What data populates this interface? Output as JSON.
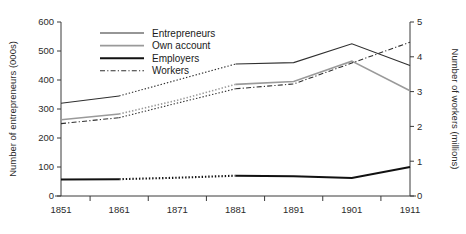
{
  "chart_data": {
    "type": "line",
    "title": "",
    "xlabel": "",
    "ylabel": "Number of entrepreneurs (000s)",
    "y2label": "Number of workers (millions)",
    "categories": [
      "1851",
      "1861",
      "1871",
      "1881",
      "1891",
      "1901",
      "1911"
    ],
    "x": [
      1851,
      1861,
      1871,
      1881,
      1891,
      1901,
      1911
    ],
    "ylim": [
      0,
      600
    ],
    "yticks": [
      0,
      100,
      200,
      300,
      400,
      500,
      600
    ],
    "y2lim": [
      0,
      5
    ],
    "y2ticks": [
      0,
      1,
      2,
      3,
      4,
      5
    ],
    "grid": false,
    "legend_position": "top-left-inside",
    "series": [
      {
        "name": "Entrepreneurs",
        "axis": "left",
        "color": "#2f2f2f",
        "width": 1.1,
        "style": "solid-dotted-solid",
        "values": [
          320,
          345,
          400,
          455,
          460,
          525,
          450
        ],
        "dotted_segment": [
          "1861",
          "1881"
        ]
      },
      {
        "name": "Own account",
        "axis": "left",
        "color": "#9a9a9a",
        "width": 1.6,
        "style": "solid-dotted-solid",
        "values": [
          263,
          283,
          330,
          385,
          395,
          465,
          363
        ],
        "dotted_segment": [
          "1861",
          "1881"
        ]
      },
      {
        "name": "Employers",
        "axis": "left",
        "color": "#111111",
        "width": 2.1,
        "style": "solid-dotted-solid",
        "values": [
          57,
          58,
          63,
          70,
          68,
          62,
          100
        ],
        "dotted_segment": [
          "1861",
          "1881"
        ]
      },
      {
        "name": "Workers",
        "axis": "right",
        "color": "#2f2f2f",
        "width": 1.1,
        "style": "dashdot-dotted-dashdot",
        "values": [
          2.08,
          2.25,
          2.67,
          3.08,
          3.22,
          3.82,
          4.42
        ],
        "dotted_segment": [
          "1861",
          "1881"
        ]
      }
    ]
  },
  "legend": {
    "items": [
      {
        "label": "Entrepreneurs",
        "swatch": "thin-solid-line"
      },
      {
        "label": "Own account",
        "swatch": "grey-solid-line"
      },
      {
        "label": "Employers",
        "swatch": "thick-solid-line"
      },
      {
        "label": "Workers",
        "swatch": "dash-dot-line"
      }
    ]
  },
  "axes": {
    "left_title": "Number of entrepreneurs (000s)",
    "right_title": "Number of workers (millions)",
    "left_ticks": [
      "0",
      "100",
      "200",
      "300",
      "400",
      "500",
      "600"
    ],
    "right_ticks": [
      "0",
      "1",
      "2",
      "3",
      "4",
      "5"
    ],
    "x_ticks": [
      "1851",
      "1861",
      "1871",
      "1881",
      "1891",
      "1901",
      "1911"
    ]
  }
}
